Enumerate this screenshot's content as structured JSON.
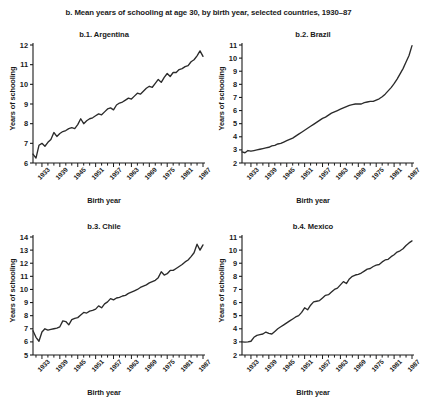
{
  "figure": {
    "title": "b. Mean years of schooling at age 30, by birth year, selected countries, 1930–87",
    "line_color": "#2b2b2b",
    "axis_color": "#1a1a1a",
    "background": "#ffffff"
  },
  "common": {
    "xlabel": "Birth year",
    "ylabel": "Years of schooling",
    "xtick_labels": [
      "1933",
      "1939",
      "1945",
      "1951",
      "1957",
      "1963",
      "1969",
      "1975",
      "1981",
      "1987"
    ],
    "xtick_values": [
      1933,
      1939,
      1945,
      1951,
      1957,
      1963,
      1969,
      1975,
      1981,
      1987
    ],
    "xlim": [
      1930,
      1987
    ]
  },
  "chart_data": [
    {
      "type": "line",
      "panel_id": "b.1",
      "title": "b.1. Argentina",
      "country": "Argentina",
      "xlabel": "Birth year",
      "ylabel": "Years of schooling",
      "xlim": [
        1930,
        1987
      ],
      "ylim": [
        6,
        12
      ],
      "ytick_labels": [
        "6",
        "7",
        "8",
        "9",
        "10",
        "11",
        "12"
      ],
      "ytick_values": [
        6,
        7,
        8,
        9,
        10,
        11,
        12
      ],
      "grid": false,
      "legend": "none",
      "x": [
        1930,
        1931,
        1932,
        1933,
        1934,
        1935,
        1936,
        1937,
        1938,
        1939,
        1940,
        1941,
        1942,
        1943,
        1944,
        1945,
        1946,
        1947,
        1948,
        1949,
        1950,
        1951,
        1952,
        1953,
        1954,
        1955,
        1956,
        1957,
        1958,
        1959,
        1960,
        1961,
        1962,
        1963,
        1964,
        1965,
        1966,
        1967,
        1968,
        1969,
        1970,
        1971,
        1972,
        1973,
        1974,
        1975,
        1976,
        1977,
        1978,
        1979,
        1980,
        1981,
        1982,
        1983,
        1984,
        1985,
        1986,
        1987
      ],
      "values": [
        6.45,
        6.25,
        6.9,
        7.0,
        6.85,
        7.05,
        7.2,
        7.55,
        7.35,
        7.5,
        7.6,
        7.65,
        7.75,
        7.8,
        7.75,
        7.95,
        8.25,
        8.0,
        8.15,
        8.25,
        8.3,
        8.4,
        8.5,
        8.45,
        8.6,
        8.75,
        8.8,
        8.7,
        8.95,
        9.05,
        9.1,
        9.2,
        9.3,
        9.25,
        9.4,
        9.55,
        9.5,
        9.65,
        9.8,
        9.9,
        9.85,
        10.05,
        10.25,
        10.1,
        10.35,
        10.55,
        10.4,
        10.6,
        10.6,
        10.75,
        10.8,
        10.9,
        10.95,
        11.15,
        11.25,
        11.45,
        11.7,
        11.42
      ]
    },
    {
      "type": "line",
      "panel_id": "b.2",
      "title": "b.2. Brazil",
      "country": "Brazil",
      "xlabel": "Birth year",
      "ylabel": "Years of schooling",
      "xlim": [
        1930,
        1987
      ],
      "ylim": [
        2,
        11
      ],
      "ytick_labels": [
        "2",
        "3",
        "4",
        "5",
        "6",
        "7",
        "8",
        "9",
        "10",
        "11"
      ],
      "ytick_values": [
        2,
        3,
        4,
        5,
        6,
        7,
        8,
        9,
        10,
        11
      ],
      "grid": false,
      "legend": "none",
      "x": [
        1930,
        1931,
        1932,
        1933,
        1934,
        1935,
        1936,
        1937,
        1938,
        1939,
        1940,
        1941,
        1942,
        1943,
        1944,
        1945,
        1946,
        1947,
        1948,
        1949,
        1950,
        1951,
        1952,
        1953,
        1954,
        1955,
        1956,
        1957,
        1958,
        1959,
        1960,
        1961,
        1962,
        1963,
        1964,
        1965,
        1966,
        1967,
        1968,
        1969,
        1970,
        1971,
        1972,
        1973,
        1974,
        1975,
        1976,
        1977,
        1978,
        1979,
        1980,
        1981,
        1982,
        1983,
        1984,
        1985,
        1986,
        1987
      ],
      "values": [
        2.85,
        2.78,
        2.95,
        2.9,
        2.95,
        3.0,
        3.05,
        3.1,
        3.15,
        3.2,
        3.3,
        3.35,
        3.45,
        3.5,
        3.6,
        3.7,
        3.8,
        3.9,
        4.05,
        4.2,
        4.35,
        4.5,
        4.65,
        4.8,
        4.95,
        5.1,
        5.25,
        5.4,
        5.5,
        5.65,
        5.8,
        5.9,
        6.0,
        6.1,
        6.2,
        6.3,
        6.4,
        6.45,
        6.5,
        6.5,
        6.5,
        6.6,
        6.65,
        6.7,
        6.7,
        6.8,
        6.9,
        7.05,
        7.25,
        7.5,
        7.75,
        8.05,
        8.4,
        8.8,
        9.2,
        9.7,
        10.2,
        10.95
      ]
    },
    {
      "type": "line",
      "panel_id": "b.3",
      "title": "b.3. Chile",
      "country": "Chile",
      "xlabel": "Birth year",
      "ylabel": "Years of schooling",
      "xlim": [
        1930,
        1987
      ],
      "ylim": [
        5,
        14
      ],
      "ytick_labels": [
        "5",
        "6",
        "7",
        "8",
        "9",
        "10",
        "11",
        "12",
        "13",
        "14"
      ],
      "ytick_values": [
        5,
        6,
        7,
        8,
        9,
        10,
        11,
        12,
        13,
        14
      ],
      "grid": false,
      "legend": "none",
      "x": [
        1930,
        1931,
        1932,
        1933,
        1934,
        1935,
        1936,
        1937,
        1938,
        1939,
        1940,
        1941,
        1942,
        1943,
        1944,
        1945,
        1946,
        1947,
        1948,
        1949,
        1950,
        1951,
        1952,
        1953,
        1954,
        1955,
        1956,
        1957,
        1958,
        1959,
        1960,
        1961,
        1962,
        1963,
        1964,
        1965,
        1966,
        1967,
        1968,
        1969,
        1970,
        1971,
        1972,
        1973,
        1974,
        1975,
        1976,
        1977,
        1978,
        1979,
        1980,
        1981,
        1982,
        1983,
        1984,
        1985,
        1986,
        1987
      ],
      "values": [
        6.85,
        6.35,
        6.05,
        6.75,
        7.0,
        6.9,
        6.95,
        7.0,
        7.05,
        7.15,
        7.6,
        7.55,
        7.3,
        7.7,
        7.8,
        7.85,
        8.05,
        8.25,
        8.2,
        8.35,
        8.4,
        8.5,
        8.75,
        8.6,
        8.9,
        9.05,
        9.3,
        9.2,
        9.35,
        9.4,
        9.5,
        9.55,
        9.7,
        9.8,
        9.9,
        10.0,
        10.15,
        10.25,
        10.35,
        10.5,
        10.6,
        10.7,
        10.9,
        11.35,
        11.1,
        11.2,
        11.45,
        11.45,
        11.6,
        11.75,
        11.9,
        12.1,
        12.25,
        12.5,
        12.8,
        13.45,
        13.0,
        13.4
      ]
    },
    {
      "type": "line",
      "panel_id": "b.4",
      "title": "b.4. Mexico",
      "country": "Mexico",
      "xlabel": "Birth year",
      "ylabel": "Years of schooling",
      "xlim": [
        1930,
        1987
      ],
      "ylim": [
        2,
        11
      ],
      "ytick_labels": [
        "2",
        "3",
        "4",
        "5",
        "6",
        "7",
        "8",
        "9",
        "10",
        "11"
      ],
      "ytick_values": [
        2,
        3,
        4,
        5,
        6,
        7,
        8,
        9,
        10,
        11
      ],
      "grid": false,
      "legend": "none",
      "x": [
        1930,
        1931,
        1932,
        1933,
        1934,
        1935,
        1936,
        1937,
        1938,
        1939,
        1940,
        1941,
        1942,
        1943,
        1944,
        1945,
        1946,
        1947,
        1948,
        1949,
        1950,
        1951,
        1952,
        1953,
        1954,
        1955,
        1956,
        1957,
        1958,
        1959,
        1960,
        1961,
        1962,
        1963,
        1964,
        1965,
        1966,
        1967,
        1968,
        1969,
        1970,
        1971,
        1972,
        1973,
        1974,
        1975,
        1976,
        1977,
        1978,
        1979,
        1980,
        1981,
        1982,
        1983,
        1984,
        1985,
        1986,
        1987
      ],
      "values": [
        3.0,
        2.98,
        3.0,
        3.05,
        3.35,
        3.5,
        3.55,
        3.6,
        3.75,
        3.65,
        3.6,
        3.8,
        4.0,
        4.15,
        4.3,
        4.45,
        4.6,
        4.75,
        4.9,
        5.0,
        5.25,
        5.6,
        5.45,
        5.8,
        6.05,
        6.1,
        6.15,
        6.35,
        6.55,
        6.6,
        6.8,
        7.0,
        7.1,
        7.35,
        7.6,
        7.45,
        7.8,
        8.0,
        8.1,
        8.15,
        8.25,
        8.4,
        8.55,
        8.6,
        8.75,
        8.85,
        8.9,
        9.1,
        9.25,
        9.3,
        9.5,
        9.65,
        9.85,
        9.95,
        10.1,
        10.35,
        10.55,
        10.7
      ]
    }
  ]
}
